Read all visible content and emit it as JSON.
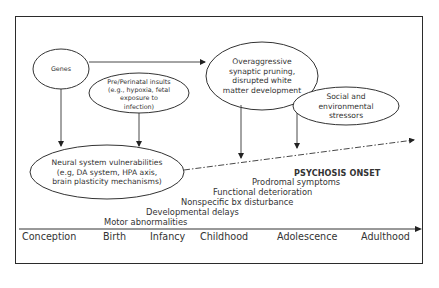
{
  "diagram": {
    "nodes": {
      "genes": {
        "label": "Genes"
      },
      "perinatal": {
        "lines": [
          "Pre/Perinatal insults",
          "(e.g., hypoxia, fetal",
          "exposure to",
          "infection)"
        ]
      },
      "pruning": {
        "lines": [
          "Overaggressive",
          "synaptic pruning,",
          "disrupted white",
          "matter development"
        ]
      },
      "social": {
        "lines": [
          "Social and",
          "environmental",
          "stressors"
        ]
      },
      "neural": {
        "lines": [
          "Neural system vulnerabilities",
          "(e.g, DA system, HPA axis,",
          "brain plasticity mechanisms)"
        ]
      }
    },
    "stages": [
      {
        "label": "Motor abnormalities"
      },
      {
        "label": "Developmental delays"
      },
      {
        "label": "Nonspecific bx disturbance"
      },
      {
        "label": "Functional deterioration"
      },
      {
        "label": "Prodromal symptoms"
      },
      {
        "label": "PSYCHOSIS ONSET"
      }
    ],
    "timeline": [
      "Conception",
      "Birth",
      "Infancy",
      "Childhood",
      "Adolescence",
      "Adulthood"
    ],
    "edges": [
      {
        "from": "genes",
        "to": "pruning",
        "style": "solid"
      },
      {
        "from": "genes",
        "to": "neural",
        "style": "solid"
      },
      {
        "from": "perinatal",
        "to": "neural",
        "style": "solid"
      },
      {
        "from": "pruning",
        "to": "stages",
        "style": "solid"
      },
      {
        "from": "social",
        "to": "stages",
        "style": "solid"
      },
      {
        "from": "neural",
        "to": "psychosis-onset",
        "style": "dash-dot"
      }
    ]
  }
}
